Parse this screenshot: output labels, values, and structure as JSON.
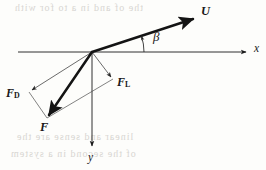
{
  "figure": {
    "kind": "vector-decomposition-diagram",
    "background_color": "#fdfdfb",
    "ink_color": "#181818",
    "thin_line_color": "#555555"
  },
  "axes": {
    "x_label": "x",
    "y_label": "y",
    "origin": {
      "x": 92,
      "y": 52
    },
    "x_axis": {
      "from_x": 18,
      "from_y": 52,
      "to_x": 250,
      "to_y": 52,
      "arrow": "right"
    },
    "y_axis": {
      "from_x": 92,
      "from_y": 52,
      "to_x": 92,
      "to_y": 150,
      "arrow": "down"
    }
  },
  "vectors": {
    "U": {
      "label": "U",
      "tip": {
        "x": 197,
        "y": 17
      },
      "tail": {
        "x": 92,
        "y": 52
      },
      "style": "bold"
    },
    "F": {
      "label": "F",
      "tip": {
        "x": 47,
        "y": 118
      },
      "tail": {
        "x": 92,
        "y": 52
      },
      "style": "bold"
    },
    "F_D": {
      "label_base": "F",
      "label_sub": "D",
      "tip": {
        "x": 29,
        "y": 92
      },
      "tail": {
        "x": 92,
        "y": 52
      },
      "style": "thin"
    },
    "F_L": {
      "label_base": "F",
      "label_sub": "L",
      "tip": {
        "x": 113,
        "y": 79
      },
      "tail": {
        "x": 92,
        "y": 52
      },
      "style": "thin"
    }
  },
  "angle": {
    "symbol": "β",
    "name": "beta",
    "between": [
      "U",
      "x"
    ],
    "arc_radius": 52
  },
  "parallelogram": {
    "vertices": [
      {
        "x": 92,
        "y": 52
      },
      {
        "x": 29,
        "y": 92
      },
      {
        "x": 47,
        "y": 118
      },
      {
        "x": 113,
        "y": 79
      }
    ]
  },
  "artifacts": {
    "bleed_top": "the of and in a to for with",
    "bleed_bottom_1": "linear  and  sense  are  the",
    "bleed_bottom_2": "of  the  second  in  a  system"
  }
}
